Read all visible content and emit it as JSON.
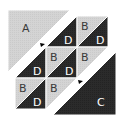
{
  "diagram": {
    "colors": {
      "light": "#d3d3d3",
      "dark": "#2b2b2b",
      "light_label": "#3a3a3a",
      "dark_label": "#f0f0f0",
      "stroke": "#ffffff",
      "background": "#ffffff"
    },
    "pieces": {
      "A": {
        "label": "A",
        "shade": "light",
        "shape": "large-triangle"
      },
      "C": {
        "label": "C",
        "shade": "dark",
        "shape": "large-triangle"
      }
    },
    "grid": {
      "rows": 3,
      "cols": 3,
      "cells": [
        [
          "",
          "D",
          "BD"
        ],
        [
          "D",
          "BD",
          "B"
        ],
        [
          "BD",
          "B",
          ""
        ]
      ]
    },
    "labels": {
      "a": "A",
      "c": "C",
      "b": "B",
      "d": "D"
    },
    "markers": [
      {
        "name": "arrow-marker-upper",
        "points_toward": "upper-left"
      },
      {
        "name": "arrow-marker-lower",
        "points_toward": "upper-left"
      }
    ]
  }
}
